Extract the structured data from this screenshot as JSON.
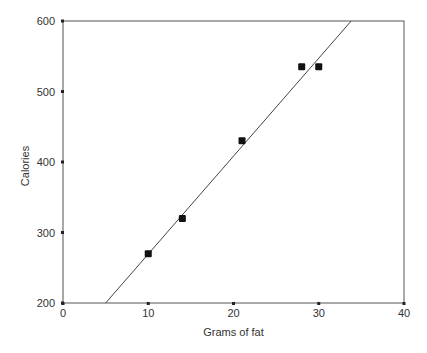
{
  "chart_data": {
    "type": "scatter",
    "title": "",
    "xlabel": "Grams of fat",
    "ylabel": "Calories",
    "xlim": [
      0,
      40
    ],
    "ylim": [
      200,
      600
    ],
    "x_ticks": [
      0,
      10,
      20,
      30,
      40
    ],
    "y_ticks": [
      200,
      300,
      400,
      500,
      600
    ],
    "grid": false,
    "legend": null,
    "series": [
      {
        "name": "Data",
        "type": "scatter",
        "marker": "square",
        "color": "#111111",
        "points": [
          {
            "x": 10,
            "y": 270
          },
          {
            "x": 14,
            "y": 320
          },
          {
            "x": 21,
            "y": 430
          },
          {
            "x": 28,
            "y": 535
          },
          {
            "x": 30,
            "y": 535
          }
        ]
      },
      {
        "name": "Fit line",
        "type": "line",
        "color": "#444444",
        "points": [
          {
            "x": 5,
            "y": 200
          },
          {
            "x": 33.8,
            "y": 600
          }
        ]
      }
    ]
  },
  "colors": {
    "axis": "#444444",
    "text": "#333333",
    "background": "#ffffff"
  }
}
